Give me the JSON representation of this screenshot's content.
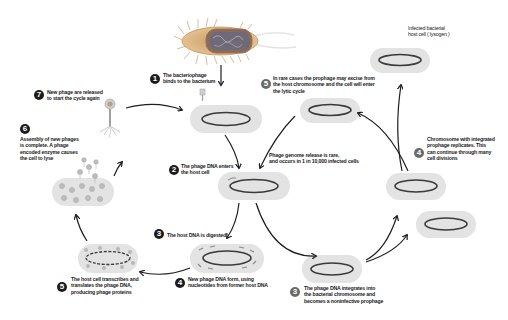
{
  "diagram": {
    "colors": {
      "cell_fill": "#e3e3e3",
      "cell_border": "#ececec",
      "chromosome": "#3a3a3a",
      "chromosome_highlight": "#c9a36a",
      "arrow": "#1e1e1e",
      "badge_dark": "#1c1c1c",
      "badge_grey": "#6a6a6a",
      "phage": "#a7a7a7",
      "bacterium_body": "#d8b07a"
    },
    "lytic_cycle": {
      "steps": [
        {
          "number": "1",
          "text_line1": "The bacteriophage",
          "text_line2": "binds to the bacterium"
        },
        {
          "number": "2",
          "text_line1": "The phage DNA enters",
          "text_line2": "the host cell"
        },
        {
          "number": "3",
          "text_line1": "The host DNA is digested"
        },
        {
          "number": "4",
          "text_line1": "New phage DNA form, using",
          "text_line2": "nucleotides from former host DNA"
        },
        {
          "number": "5",
          "text_line1": "The host cell transcribes and",
          "text_line2": "translates the phage DNA,",
          "text_line3": "producing phage proteins"
        },
        {
          "number": "6",
          "text_line1": "Assembly of new phages",
          "text_line2": "is complete. A phage",
          "text_line3": "encoded enzyme causes",
          "text_line4": "the cell to lyse"
        },
        {
          "number": "7",
          "text_line1": "New phage are released",
          "text_line2": "to start the cycle again"
        }
      ]
    },
    "lysogenic_cycle": {
      "steps": [
        {
          "number": "3",
          "text_line1": "The phage DNA integrates into",
          "text_line2": "the bacterial chromosome and",
          "text_line3": "becomes a noninfective prophage"
        },
        {
          "number": "4",
          "text_line1": "Chromosome with integrated",
          "text_line2": "prophage replicates. This",
          "text_line3": "can continue through many",
          "text_line4": "cell divisions"
        },
        {
          "number": "5",
          "text_line1": "In rare cases the prophage may excise from",
          "text_line2": "the host chromosome and the cell will enter",
          "text_line3": "the lytic cycle"
        }
      ],
      "release_note_line1": "Phage genome release is rare,",
      "release_note_line2": "and occurs in 1 in 10,000 infected cells",
      "lysogen_label_line1": "Infected bacterial",
      "lysogen_label_line2": "host cell ( lysogen )"
    }
  }
}
